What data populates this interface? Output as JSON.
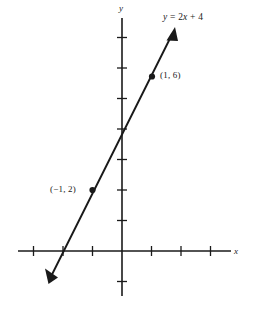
{
  "figure": {
    "background_color": "#ffffff",
    "ink_color": "#1a1a1a"
  },
  "axes": {
    "x_label": "x",
    "y_label": "y",
    "origin_px": {
      "x": 122,
      "y": 251
    },
    "unit_px": {
      "x": 29.5,
      "y": 30.5
    },
    "x_range": [
      -3.5,
      3.7
    ],
    "y_range": [
      -1.0,
      7.6
    ],
    "grid": false,
    "x_tick_values": [
      -3,
      -2,
      -1,
      1,
      2,
      3
    ],
    "y_tick_values": [
      -1,
      1,
      2,
      3,
      4,
      5,
      6,
      7
    ],
    "tick_labels_shown": false
  },
  "chart_data": {
    "type": "line",
    "title": "y = 2x + 4",
    "xlabel": "x",
    "ylabel": "y",
    "xlim": [
      -3.5,
      3.7
    ],
    "ylim": [
      -1.0,
      7.6
    ],
    "grid": false,
    "legend": "none",
    "equation": "y = 2x + 4",
    "slope": 2,
    "intercept": 4,
    "series": [
      {
        "name": "y = 2x + 4",
        "x": [
          -2.4,
          1.7
        ],
        "values": [
          -0.8,
          7.4
        ],
        "arrow_start": true,
        "arrow_end": true,
        "color": "#1a1a1a"
      }
    ],
    "points": [
      {
        "label": "(1, 6)",
        "x": 1,
        "y": 6
      },
      {
        "label": "(−1, 2)",
        "x": -1,
        "y": 2
      }
    ],
    "annotations": [
      {
        "text": "y = 2x + 4",
        "x": 1.4,
        "y": 7.8
      }
    ]
  },
  "labels": {
    "equation": {
      "y": "y",
      "eq": " = 2",
      "x": "x",
      "rest": " + 4"
    },
    "equation_text": "y = 2x + 4",
    "point_one": "(1, 6)",
    "point_two": "(−1, 2)",
    "axis_x": "x",
    "axis_y": "y"
  }
}
